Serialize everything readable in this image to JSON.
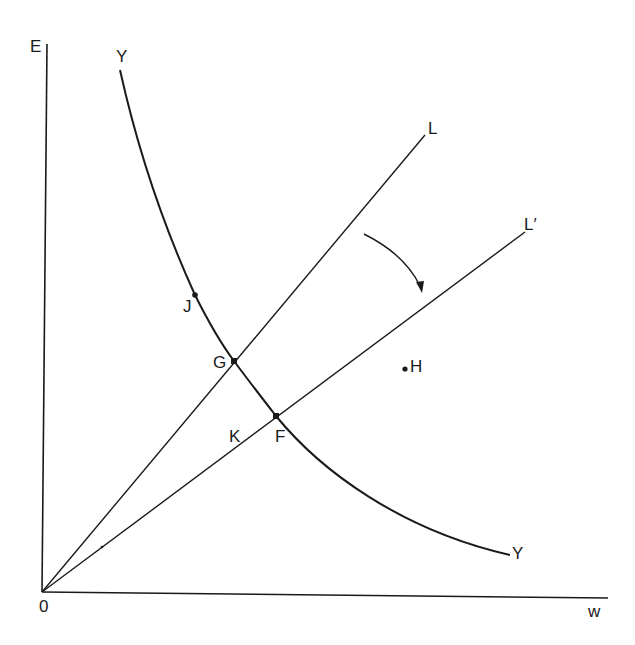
{
  "diagram": {
    "axes": {
      "y_label": "E",
      "x_label": "w",
      "origin_label": "0"
    },
    "curves": {
      "Y": {
        "label_start": "Y",
        "label_end": "Y"
      }
    },
    "lines": {
      "L": {
        "label": "L"
      },
      "L_prime": {
        "label": "L′"
      }
    },
    "points": {
      "J": "J",
      "G": "G",
      "F": "F",
      "K": "K",
      "H": "H"
    },
    "annotations": {
      "rotation_arrow": "arrow indicating rotation of L to L′"
    },
    "colors": {
      "ink": "#1a1a1a",
      "background": "#ffffff"
    }
  }
}
